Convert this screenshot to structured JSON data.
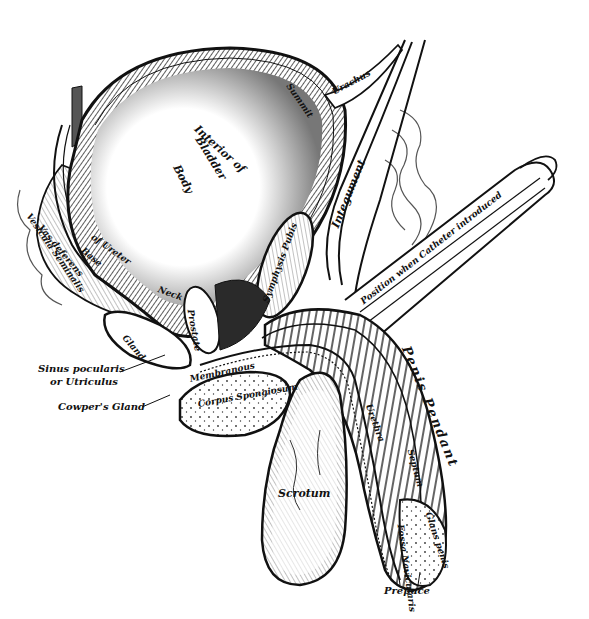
{
  "figure": {
    "colors": {
      "ink": "#111111",
      "shade": "#6b6b6b",
      "mid": "#9a9a9a",
      "light": "#d6d6d6",
      "paper": "#ffffff"
    }
  },
  "labels": {
    "interior_of_bladder": "Interior of",
    "bladder": "Bladder",
    "body": "Body",
    "summit": "Summit",
    "urachus": "Urachus",
    "integument": "Integument",
    "symphysis_pubis": "Symphysis Pubis",
    "catheter": "Position when Catheter introduced",
    "vesicula_seminalis": "Vesicula Seminalis",
    "vas_deferens": "Vas deferens",
    "of_ureter": "of Ureter",
    "base": "Base",
    "neck": "Neck",
    "prostate": "Prostate",
    "gland": "Gland",
    "membranous": "Membranous",
    "sinus_pocularis": "Sinus pocularis",
    "or_utriculus": "or Utriculus",
    "cowpers_gland": "Cowper's Gland",
    "corpus_spongiosum": "Corpus Spongiosum",
    "penis_pendant": "Penis Pendant",
    "urethra": "Urethra",
    "septum": "Septum",
    "scrotum": "Scrotum",
    "fossa_navicularis": "Fossa Navicularis",
    "glans_penis": "Glans penis",
    "prepuce": "Prepuce"
  }
}
